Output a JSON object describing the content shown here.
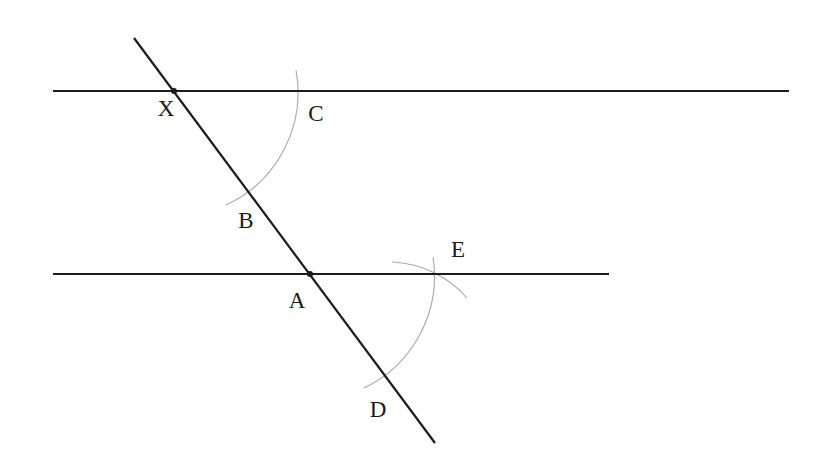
{
  "diagram": {
    "colors": {
      "line": "#1c1c1c",
      "arc": "#a8a8a8",
      "label": "#1a1a1a",
      "background": "#ffffff"
    },
    "lines": [
      {
        "id": "upper-line",
        "x1": 53,
        "y1": 91,
        "x2": 789,
        "y2": 91
      },
      {
        "id": "lower-line",
        "x1": 53,
        "y1": 274,
        "x2": 609,
        "y2": 274
      },
      {
        "id": "transversal",
        "x1": 134,
        "y1": 38,
        "x2": 435,
        "y2": 443
      }
    ],
    "points": [
      {
        "id": "X",
        "x": 174,
        "y": 91,
        "dot": true
      },
      {
        "id": "A",
        "x": 310,
        "y": 274,
        "dot": true
      },
      {
        "id": "B",
        "x": 248,
        "y": 190,
        "dot": false
      },
      {
        "id": "C",
        "x": 298,
        "y": 91,
        "dot": false
      },
      {
        "id": "D",
        "x": 384,
        "y": 374,
        "dot": false
      },
      {
        "id": "E",
        "x": 434,
        "y": 274,
        "dot": false
      }
    ],
    "arcs": [
      {
        "id": "arc-center-X",
        "d": "M 296 70 A 124 124 0 0 1 226 205"
      },
      {
        "id": "arc-center-A",
        "d": "M 433 257 A 124 124 0 0 1 364 388"
      },
      {
        "id": "arc-center-D",
        "d": "M 392 262 A 106 106 0 0 1 467 298"
      }
    ],
    "labels": [
      {
        "text": "X",
        "x": 166,
        "y": 116
      },
      {
        "text": "C",
        "x": 316,
        "y": 121
      },
      {
        "text": "B",
        "x": 246,
        "y": 228
      },
      {
        "text": "A",
        "x": 297,
        "y": 308
      },
      {
        "text": "E",
        "x": 458,
        "y": 257
      },
      {
        "text": "D",
        "x": 378,
        "y": 417
      }
    ]
  }
}
